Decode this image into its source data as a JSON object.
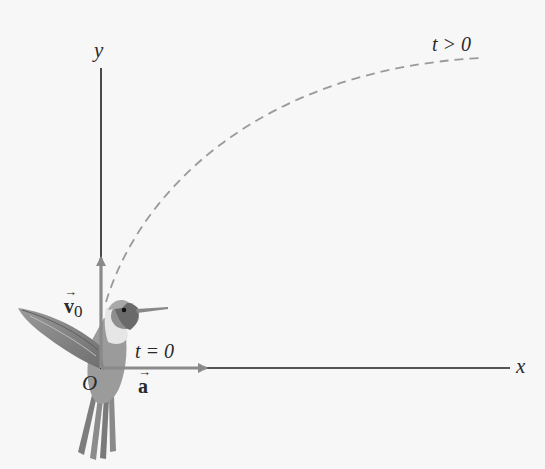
{
  "figure": {
    "axes": {
      "x_label": "x",
      "y_label": "y",
      "origin_label": "O"
    },
    "vectors": {
      "initial_velocity": {
        "symbol": "v",
        "subscript": "0",
        "direction": "up (+y)"
      },
      "acceleration": {
        "symbol": "a",
        "direction": "right (+x)"
      }
    },
    "time_labels": {
      "initial": "t = 0",
      "later": "t > 0"
    },
    "trajectory": {
      "style": "dashed",
      "shape": "curve bending from +y toward +x"
    },
    "colors": {
      "axis": "#1e1e1e",
      "vector": "#8a8a8a",
      "trajectory": "#9a9a9a",
      "background": "#f7f7f7"
    }
  }
}
